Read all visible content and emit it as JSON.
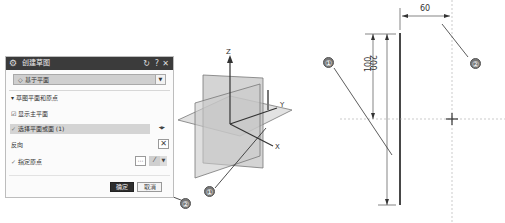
{
  "dialog": {
    "title": "创建草图",
    "controls": {
      "reset_icon": "↻",
      "help_icon": "?",
      "close_icon": "✕"
    },
    "type_select": {
      "icon": "◇",
      "value": "基于平面"
    },
    "section": {
      "label": "草图平面和原点",
      "toggle": "▾"
    },
    "show_main_plane": {
      "label": "显示主平面",
      "checked": true
    },
    "select_plane": {
      "label": "选择平面或面 (1)",
      "check": "✓"
    },
    "reverse": {
      "label": "反向"
    },
    "specify_origin": {
      "label": "指定原点",
      "check": "✓"
    },
    "ok_label": "确定",
    "cancel_label": "取消"
  },
  "viewport": {
    "axes": {
      "z": "Z",
      "y": "Y",
      "x": "X"
    }
  },
  "drawing": {
    "dim_horizontal": "60",
    "dim_vertical_outer": "200",
    "dim_vertical_inner": "100"
  },
  "callouts": {
    "left_1": "①",
    "left_2": "②",
    "right_1": "①",
    "right_2": "②"
  },
  "colors": {
    "titlebar": "#3b3b3b",
    "selected_row": "#d4d4d4",
    "ok_button": "#2e2e2e",
    "callout": "#777777"
  }
}
